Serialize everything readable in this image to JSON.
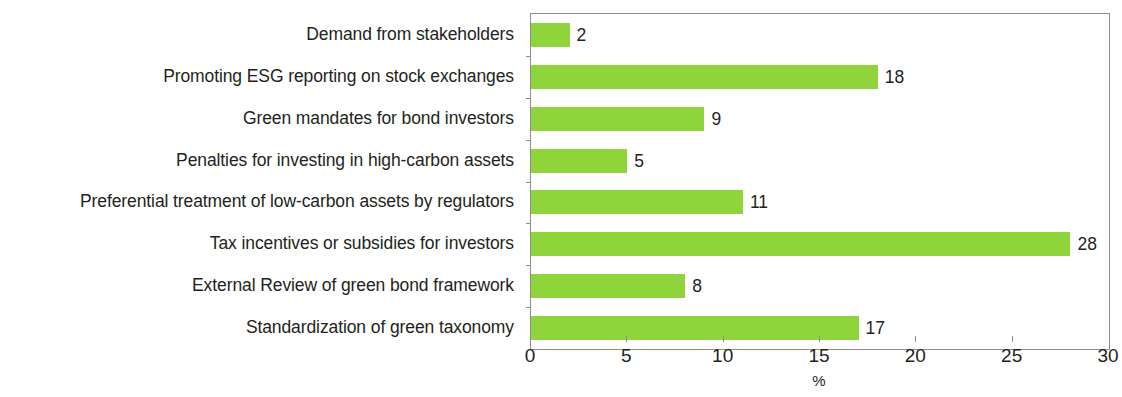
{
  "chart_data": {
    "type": "bar",
    "orientation": "horizontal",
    "title": "",
    "subtitle": "",
    "xlabel": "%",
    "ylabel": "",
    "xlim": [
      0,
      30
    ],
    "xticks": [
      "0",
      "5",
      "10",
      "15",
      "20",
      "25",
      "30"
    ],
    "grid": false,
    "legend": null,
    "bar_color": "#8ED43A",
    "text_color": "#231F20",
    "axis_color": "#8D8F8E",
    "categories": [
      "Demand from stakeholders",
      "Promoting ESG reporting on stock exchanges",
      "Green mandates for bond investors",
      "Penalties for investing in high-carbon assets",
      "Preferential treatment of low-carbon assets by regulators",
      "Tax incentives or subsidies for investors",
      "External Review of green bond framework",
      "Standardization of green taxonomy"
    ],
    "values": [
      2,
      18,
      9,
      5,
      11,
      28,
      8,
      17
    ],
    "value_labels": [
      "2",
      "18",
      "9",
      "5",
      "11",
      "28",
      "8",
      "17"
    ]
  }
}
